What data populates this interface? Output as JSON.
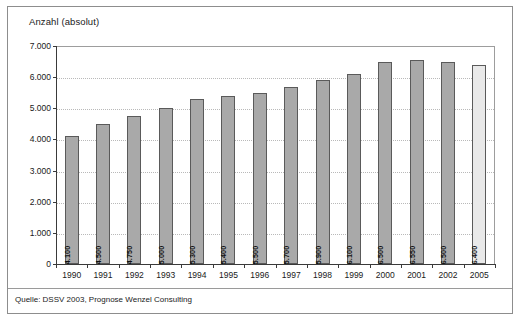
{
  "figure": {
    "axis_title": "Anzahl (absolut)",
    "source_note": "Quelle: DSSV 2003, Prognose Wenzel Consulting"
  },
  "chart_data": {
    "type": "bar",
    "title": "Anzahl (absolut)",
    "xlabel": "",
    "ylabel": "Anzahl (absolut)",
    "ylim": [
      0,
      7000
    ],
    "ytick_labels": [
      "0",
      "1.000",
      "2.000",
      "3.000",
      "4.000",
      "5.000",
      "6.000",
      "7.000"
    ],
    "ytick_values": [
      0,
      1000,
      2000,
      3000,
      4000,
      5000,
      6000,
      7000
    ],
    "grid": true,
    "legend": "none",
    "categories": [
      "1990",
      "1991",
      "1992",
      "1993",
      "1994",
      "1995",
      "1996",
      "1997",
      "1998",
      "1999",
      "2000",
      "2001",
      "2002",
      "2005"
    ],
    "values": [
      4100,
      4500,
      4750,
      5000,
      5300,
      5400,
      5500,
      5700,
      5900,
      6100,
      6500,
      6550,
      6500,
      6400
    ],
    "value_labels": [
      "4.100",
      "4.500",
      "4.750",
      "5.000",
      "5.300",
      "5.400",
      "5.500",
      "5.700",
      "5.900",
      "6.100",
      "6.500",
      "6.550",
      "6.500",
      "6.400"
    ],
    "bar_kinds": [
      "normal",
      "normal",
      "normal",
      "normal",
      "normal",
      "normal",
      "normal",
      "normal",
      "normal",
      "normal",
      "normal",
      "normal",
      "normal",
      "forecast"
    ],
    "colors": {
      "bar_normal": "#a9a9a9",
      "bar_forecast": "#e9e9e9",
      "bar_border": "#5a5a5a",
      "gridline": "#b9b9b9",
      "axis": "#3a3a3a",
      "text": "#1a1a1a",
      "frame": "#8d8d8d",
      "background": "#ffffff"
    }
  }
}
